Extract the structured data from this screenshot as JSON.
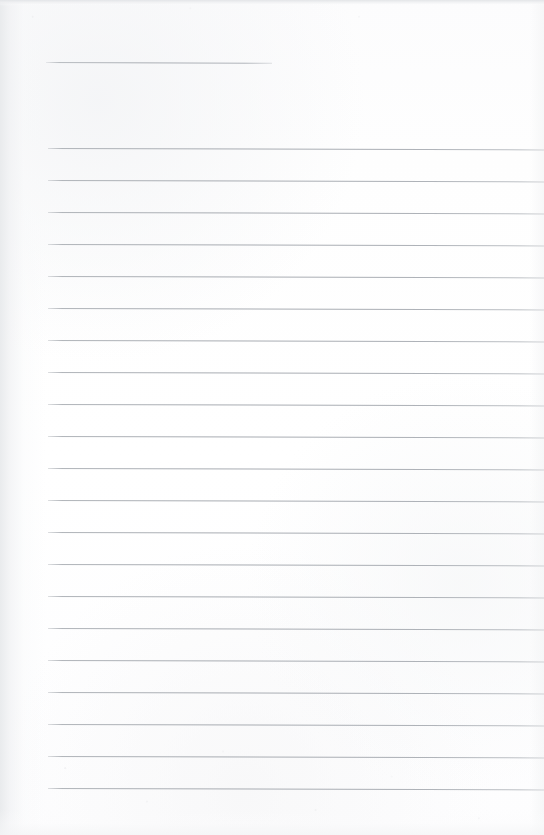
{
  "document": {
    "kind": "scanned-blank-lined-page",
    "title": "",
    "visible_text": "",
    "page_width": 544,
    "page_height": 835,
    "background_color": "#fdfdfd",
    "rule_color": "#adb1b7",
    "edge_shade_color": "#e8eaec",
    "notes": ""
  },
  "header_rule": {
    "name": "title-rule",
    "x": 46,
    "y": 62,
    "width": 226,
    "skew_deg": 0.18,
    "thickness": 1
  },
  "body_rules": {
    "count": 21,
    "x": 48,
    "right_edge": 544,
    "first_y": 148,
    "spacing": 32,
    "skew_deg": 0.16,
    "thickness": 1,
    "y_positions": [
      148,
      180,
      212,
      244,
      276,
      308,
      340,
      372,
      404,
      436,
      468,
      500,
      532,
      564,
      596,
      628,
      660,
      692,
      724,
      756,
      788
    ],
    "line_text": [
      "",
      "",
      "",
      "",
      "",
      "",
      "",
      "",
      "",
      "",
      "",
      "",
      "",
      "",
      "",
      "",
      "",
      "",
      "",
      "",
      ""
    ]
  }
}
